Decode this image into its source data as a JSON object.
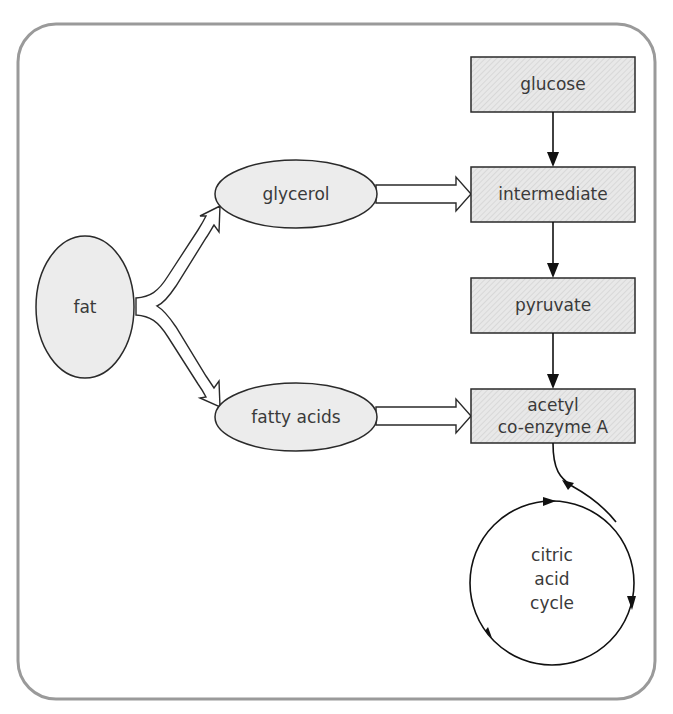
{
  "diagram": {
    "frame": {
      "border_color": "#9a9a9a",
      "background": "#ffffff"
    },
    "colors": {
      "node_fill": "#ececec",
      "box_fill": "#e6e6e6",
      "stroke": "#2a2a2a",
      "text": "#3a3a3a"
    },
    "nodes": {
      "fat": {
        "label": "fat",
        "shape": "ellipse"
      },
      "glycerol": {
        "label": "glycerol",
        "shape": "ellipse"
      },
      "fatty_acids": {
        "label": "fatty acids",
        "shape": "ellipse"
      },
      "glucose": {
        "label": "glucose",
        "shape": "box"
      },
      "intermediate": {
        "label": "intermediate",
        "shape": "box"
      },
      "pyruvate": {
        "label": "pyruvate",
        "shape": "box"
      },
      "acetyl_line1": {
        "label": "acetyl",
        "shape": "box"
      },
      "acetyl_line2": {
        "label": "co-enzyme A",
        "shape": "box"
      },
      "cycle_line1": {
        "label": "citric"
      },
      "cycle_line2": {
        "label": "acid"
      },
      "cycle_line3": {
        "label": "cycle"
      }
    },
    "edges": [
      {
        "from": "fat",
        "to": "glycerol",
        "style": "hollow-arrow"
      },
      {
        "from": "fat",
        "to": "fatty acids",
        "style": "hollow-arrow"
      },
      {
        "from": "glycerol",
        "to": "intermediate",
        "style": "hollow-arrow"
      },
      {
        "from": "fatty acids",
        "to": "acetyl co-enzyme A",
        "style": "hollow-arrow"
      },
      {
        "from": "glucose",
        "to": "intermediate",
        "style": "line-arrow"
      },
      {
        "from": "intermediate",
        "to": "pyruvate",
        "style": "line-arrow"
      },
      {
        "from": "pyruvate",
        "to": "acetyl co-enzyme A",
        "style": "line-arrow"
      },
      {
        "from": "acetyl co-enzyme A",
        "to": "citric acid cycle",
        "style": "curved-line-arrow"
      }
    ]
  }
}
